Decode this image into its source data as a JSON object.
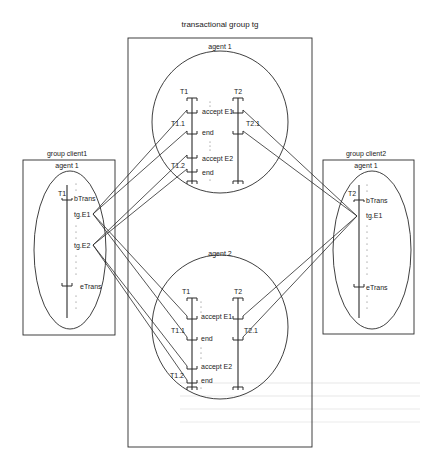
{
  "diagram": {
    "central_group": {
      "title": "transactional group tg",
      "agents": [
        {
          "label": "agent 1",
          "threads": [
            {
              "name": "T1",
              "events": [
                "accept E1",
                "end",
                "accept E2",
                "end"
              ],
              "subthreads": [
                "T1.1",
                "T1.2"
              ]
            },
            {
              "name": "T2",
              "events": [],
              "subthreads": [
                "T2.1"
              ]
            }
          ]
        },
        {
          "label": "agent 2",
          "threads": [
            {
              "name": "T1",
              "events": [
                "accept E1",
                "end",
                "accept E2",
                "end"
              ],
              "subthreads": [
                "T1.1",
                "T1.2"
              ]
            },
            {
              "name": "T2",
              "events": [],
              "subthreads": [
                "T2.1"
              ]
            }
          ]
        }
      ]
    },
    "client1": {
      "title": "group client1",
      "agent": "agent 1",
      "thread": "T1",
      "events": [
        "bTrans",
        "tg.E1",
        "tg.E2",
        "eTrans"
      ]
    },
    "client2": {
      "title": "group client2",
      "agent": "agent 1",
      "thread": "T2",
      "events": [
        "bTrans",
        "tg.E1",
        "eTrans"
      ]
    },
    "colors": {
      "line": "#2a2a2a",
      "background": "#ffffff",
      "bleed_through": "#e4e4e4"
    }
  }
}
